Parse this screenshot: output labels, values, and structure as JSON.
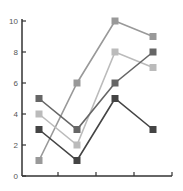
{
  "chart_data": {
    "type": "line",
    "title": "",
    "xlabel": "",
    "ylabel": "",
    "categories": [
      "1",
      "2",
      "3",
      "4"
    ],
    "ylim": [
      0,
      10
    ],
    "yticks": [
      "0",
      "2",
      "4",
      "6",
      "8",
      "10"
    ],
    "grid": false,
    "legend": null,
    "series": [
      {
        "name": "Series 1",
        "color": "#999999",
        "values": [
          1,
          6,
          10,
          9
        ]
      },
      {
        "name": "Series 2",
        "color": "#bbbbbb",
        "values": [
          4,
          2,
          8,
          7
        ]
      },
      {
        "name": "Series 3",
        "color": "#666666",
        "values": [
          5,
          3,
          6,
          8
        ]
      },
      {
        "name": "Series 4",
        "color": "#444444",
        "values": [
          3,
          1,
          5,
          3
        ]
      }
    ]
  }
}
